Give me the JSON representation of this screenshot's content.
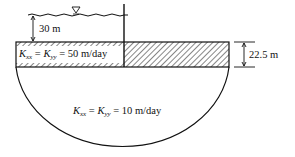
{
  "diagram": {
    "labels": {
      "upper_depth": "30 m",
      "layer_thickness": "22.5 m",
      "upper_layer_k": {
        "k_symbol": "K",
        "sub_x": "xx",
        "sub_y": "yy",
        "equals": "=",
        "value": "50 m/day"
      },
      "lower_layer_k": {
        "k_symbol": "K",
        "sub_x": "xx",
        "sub_y": "yy",
        "equals": "=",
        "value": "10 m/day"
      }
    },
    "symbols": {
      "water_surface_marker": "▽"
    }
  }
}
